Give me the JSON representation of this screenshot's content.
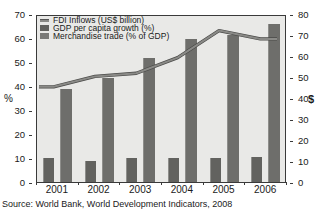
{
  "chart_data": {
    "type": "bar",
    "title": "",
    "subtitle": "",
    "categories": [
      "2001",
      "2002",
      "2003",
      "2004",
      "2005",
      "2006"
    ],
    "xlabel": "",
    "ylabel": "%",
    "ylabel_right": "$",
    "ylim": [
      0,
      70
    ],
    "ylim_right": [
      0,
      80
    ],
    "yticks": [
      0,
      10,
      20,
      30,
      40,
      50,
      60,
      70
    ],
    "yticks_right": [
      0,
      10,
      20,
      30,
      40,
      50,
      60,
      70,
      80
    ],
    "grid": false,
    "legend_position": "top-left",
    "series": [
      {
        "name": "FDI Inflows (US$ billion)",
        "type": "line",
        "axis": "right",
        "unit": "US$ billion",
        "values": [
          46,
          51,
          52.5,
          60,
          73,
          69
        ]
      },
      {
        "name": "GDP per capita growth (%)",
        "type": "bar",
        "axis": "left",
        "unit": "%",
        "values": [
          9.8,
          8.7,
          10.0,
          10.0,
          10.0,
          10.3
        ]
      },
      {
        "name": "Merchandise trade (% of GDP)",
        "type": "bar",
        "axis": "left",
        "unit": "% of GDP",
        "values": [
          38.7,
          43.2,
          51.5,
          59.5,
          61.3,
          65.8
        ]
      }
    ],
    "source": "Source: World Bank, World Development Indicators, 2008"
  },
  "legend": {
    "items": [
      {
        "label": "FDI Inflows (US$ billion)",
        "marker": "line",
        "color": "#8a8a87"
      },
      {
        "label": "GDP per capita growth (%)",
        "marker": "square",
        "color": "#62625f"
      },
      {
        "label": "Merchandise trade (% of GDP)",
        "marker": "square",
        "color": "#7a7a77"
      }
    ]
  },
  "axes": {
    "left_title": "%",
    "right_title": "$",
    "left_ticks": [
      "0",
      "10",
      "20",
      "30",
      "40",
      "50",
      "60",
      "70"
    ],
    "right_ticks": [
      "0",
      "10",
      "20",
      "30",
      "40",
      "50",
      "60",
      "70",
      "80"
    ]
  },
  "footer": {
    "source": "Source: World Bank, World Development Indicators, 2008"
  },
  "colors": {
    "plot_background": "#e9e9e7",
    "bar_trade": "#6e6e6b",
    "bar_gdp": "#62625f",
    "line_fdi": "#8a8a87",
    "axis": "#3a3a3a",
    "text": "#1a1a1a"
  }
}
